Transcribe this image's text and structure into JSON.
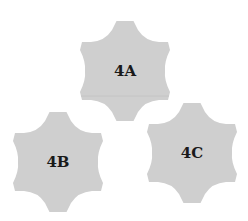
{
  "background_color": "#ffffff",
  "piece_fill": "#cfcfcf",
  "label_color": "#1a1a1a",
  "pieces": [
    {
      "id": "4A",
      "label": "4A",
      "cx": 125,
      "cy": 71
    },
    {
      "id": "4B",
      "label": "4B",
      "cx": 58,
      "cy": 162
    },
    {
      "id": "4C",
      "label": "4C",
      "cx": 192,
      "cy": 153
    }
  ]
}
